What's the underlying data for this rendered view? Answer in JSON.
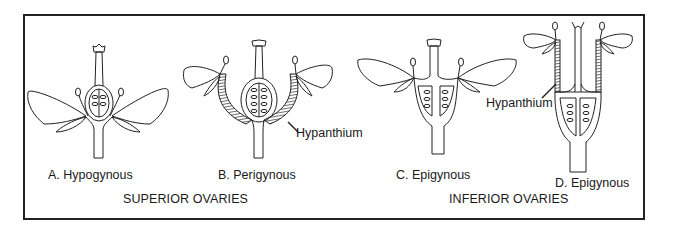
{
  "figure": {
    "panels": [
      {
        "id": "A",
        "label": "A. Hypogynous"
      },
      {
        "id": "B",
        "label": "B. Perigynous",
        "annotation": "Hypanthium"
      },
      {
        "id": "C",
        "label": "C. Epigynous"
      },
      {
        "id": "D",
        "label": "D. Epigynous",
        "annotation": "Hypanthium"
      }
    ],
    "groups": {
      "superior": "SUPERIOR OVARIES",
      "inferior": "INFERIOR OVARIES"
    }
  }
}
